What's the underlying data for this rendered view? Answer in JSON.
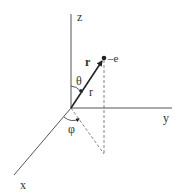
{
  "diagram": {
    "type": "spherical-coordinates",
    "colors": {
      "background": "#ffffff",
      "axis": "#555555",
      "vector": "#222222",
      "dashed": "#666666",
      "text": "#333333"
    },
    "axes": {
      "z_label": "z",
      "y_label": "y",
      "x_label": "x"
    },
    "point": {
      "label": "–e"
    },
    "vector": {
      "bold_label": "r",
      "length_label": "r"
    },
    "angles": {
      "polar_label": "θ",
      "azimuth_label": "φ"
    }
  }
}
